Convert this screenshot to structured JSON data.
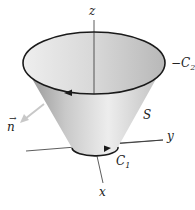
{
  "figure": {
    "labels": {
      "z_axis": "z",
      "y_axis": "y",
      "x_axis": "x",
      "top_curve": "−C",
      "top_curve_sub": "2",
      "bottom_curve": "C",
      "bottom_curve_sub": "1",
      "surface": "S",
      "normal": "n"
    },
    "colors": {
      "curve": "#1a1a1a",
      "axis": "#333333",
      "normal_arrow": "#c8c8c8",
      "surface_light": "#e6e6e6",
      "surface_dark": "#a8a8a8",
      "interior": "#d4d4d4"
    }
  }
}
